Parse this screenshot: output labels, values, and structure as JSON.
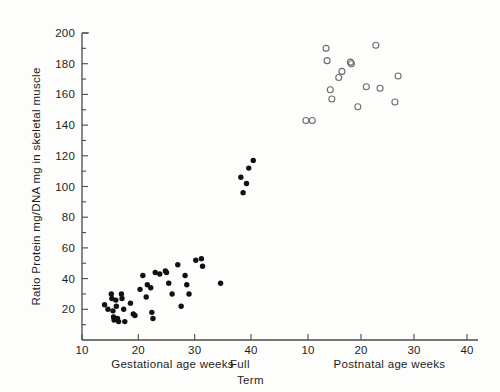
{
  "chart_data": {
    "type": "scatter",
    "title": "",
    "subtitle": "",
    "ylabel": "Ratio Protein mg/DNA mg in skeletal muscle",
    "ylim": [
      0,
      200
    ],
    "yticks_labeled": [
      20,
      40,
      60,
      80,
      100,
      120,
      140,
      160,
      180,
      200
    ],
    "ytick_minor_step": 10,
    "grid": false,
    "legend": "none",
    "xlabel_left": "Gestational age weeks",
    "xlabel_right": "Postnatal age weeks",
    "xlabel_center": "Full",
    "xlabel_center2": "Term",
    "xticks_left": [
      10,
      20,
      30,
      40
    ],
    "xticks_right": [
      10,
      20,
      30,
      40
    ],
    "x_axis_note": "two concatenated axes: gestational 10-40 weeks then postnatal 10-40 weeks",
    "series": [
      {
        "name": "Gestational age (filled circles)",
        "marker": "filled-circle",
        "color": "#111111",
        "points": [
          {
            "x": 14.0,
            "y": 23
          },
          {
            "x": 14.6,
            "y": 20
          },
          {
            "x": 15.2,
            "y": 30
          },
          {
            "x": 15.3,
            "y": 27
          },
          {
            "x": 15.5,
            "y": 19
          },
          {
            "x": 15.6,
            "y": 15
          },
          {
            "x": 15.7,
            "y": 13
          },
          {
            "x": 16.0,
            "y": 26
          },
          {
            "x": 16.1,
            "y": 22
          },
          {
            "x": 16.3,
            "y": 14
          },
          {
            "x": 16.5,
            "y": 12
          },
          {
            "x": 17.0,
            "y": 30
          },
          {
            "x": 17.1,
            "y": 27
          },
          {
            "x": 17.4,
            "y": 20
          },
          {
            "x": 17.6,
            "y": 12
          },
          {
            "x": 18.6,
            "y": 24
          },
          {
            "x": 19.1,
            "y": 17
          },
          {
            "x": 19.4,
            "y": 16
          },
          {
            "x": 20.3,
            "y": 33
          },
          {
            "x": 20.8,
            "y": 42
          },
          {
            "x": 21.4,
            "y": 28
          },
          {
            "x": 21.6,
            "y": 36
          },
          {
            "x": 22.2,
            "y": 34
          },
          {
            "x": 22.4,
            "y": 18
          },
          {
            "x": 22.6,
            "y": 14
          },
          {
            "x": 23.0,
            "y": 44
          },
          {
            "x": 23.8,
            "y": 43
          },
          {
            "x": 24.8,
            "y": 45
          },
          {
            "x": 25.0,
            "y": 44
          },
          {
            "x": 25.4,
            "y": 37
          },
          {
            "x": 26.0,
            "y": 30
          },
          {
            "x": 27.0,
            "y": 49
          },
          {
            "x": 27.6,
            "y": 22
          },
          {
            "x": 28.3,
            "y": 42
          },
          {
            "x": 28.6,
            "y": 36
          },
          {
            "x": 29.0,
            "y": 30
          },
          {
            "x": 30.2,
            "y": 52
          },
          {
            "x": 31.2,
            "y": 53
          },
          {
            "x": 31.4,
            "y": 48
          },
          {
            "x": 34.6,
            "y": 37
          },
          {
            "x": 38.2,
            "y": 106
          },
          {
            "x": 38.6,
            "y": 96
          },
          {
            "x": 39.2,
            "y": 102
          },
          {
            "x": 39.6,
            "y": 112
          },
          {
            "x": 40.4,
            "y": 117
          }
        ]
      },
      {
        "name": "Postnatal age (open circles)",
        "marker": "open-circle",
        "color": "#6d6d6d",
        "points": [
          {
            "x": 9.6,
            "y": 143
          },
          {
            "x": 10.8,
            "y": 143
          },
          {
            "x": 13.4,
            "y": 190
          },
          {
            "x": 13.6,
            "y": 182
          },
          {
            "x": 14.2,
            "y": 163
          },
          {
            "x": 14.5,
            "y": 157
          },
          {
            "x": 15.8,
            "y": 171
          },
          {
            "x": 16.4,
            "y": 175
          },
          {
            "x": 18.0,
            "y": 181
          },
          {
            "x": 18.2,
            "y": 180
          },
          {
            "x": 19.4,
            "y": 152
          },
          {
            "x": 21.0,
            "y": 165
          },
          {
            "x": 22.8,
            "y": 192
          },
          {
            "x": 23.6,
            "y": 164
          },
          {
            "x": 26.4,
            "y": 155
          },
          {
            "x": 27.0,
            "y": 172
          }
        ]
      }
    ]
  }
}
